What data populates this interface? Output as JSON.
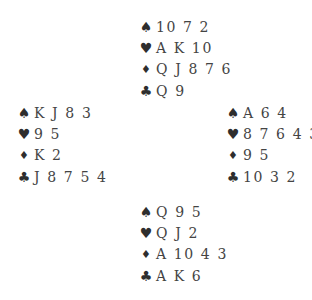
{
  "suits": {
    "spades": "♠",
    "hearts": "♥",
    "diamonds": "♦",
    "clubs": "♣"
  },
  "hands": {
    "north": {
      "spades": "10 7 2",
      "hearts": "A K 10",
      "diamonds": "Q J 8 7 6",
      "clubs": "Q 9"
    },
    "west": {
      "spades": "K J 8 3",
      "hearts": "9 5",
      "diamonds": "K 2",
      "clubs": "J 8 7 5 4"
    },
    "east": {
      "spades": "A 6 4",
      "hearts": "8 7 6 4 3",
      "diamonds": "9 5",
      "clubs": "10 3 2"
    },
    "south": {
      "spades": "Q 9 5",
      "hearts": "Q J 2",
      "diamonds": "A 10 4 3",
      "clubs": "A K 6"
    }
  }
}
